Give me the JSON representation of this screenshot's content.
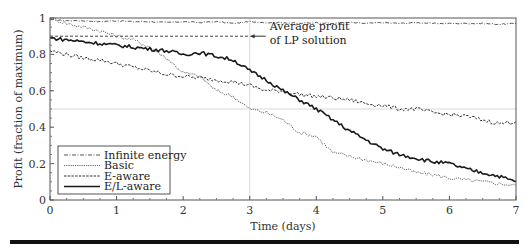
{
  "chart_data": {
    "type": "line",
    "title": "",
    "xlabel": "Time (days)",
    "ylabel": "Profit (fraction of maximum)",
    "xlim": [
      0,
      7
    ],
    "ylim": [
      0,
      1
    ],
    "xticks": [
      0,
      1,
      2,
      3,
      4,
      5,
      6,
      7
    ],
    "yticks": [
      0,
      0.2,
      0.4,
      0.6,
      0.8,
      1
    ],
    "ytick_labels": [
      "0",
      "0.2",
      "0.4",
      "0.6",
      "0.8",
      "1"
    ],
    "grid": false,
    "reference_lines": [
      {
        "type": "horizontal",
        "y": 0.9,
        "x_range": [
          0,
          3
        ],
        "style": "dashed",
        "label": "Average profit of LP solution"
      },
      {
        "type": "vertical",
        "x": 3,
        "style": "thin-gray"
      },
      {
        "type": "horizontal",
        "y": 0.5,
        "style": "thin-gray"
      }
    ],
    "annotation": {
      "text_line1": "Average profit",
      "text_line2": "of LP solution",
      "arrow_to": [
        3.0,
        0.9
      ]
    },
    "legend_position": "lower-left",
    "x": [
      0,
      0.25,
      0.5,
      0.75,
      1,
      1.25,
      1.5,
      1.75,
      2,
      2.25,
      2.5,
      2.75,
      3,
      3.25,
      3.5,
      3.75,
      4,
      4.25,
      4.5,
      4.75,
      5,
      5.25,
      5.5,
      5.75,
      6,
      6.25,
      6.5,
      6.75,
      7
    ],
    "series": [
      {
        "name": "Infinite energy",
        "style": "dash-dot",
        "values": [
          0.99,
          0.985,
          0.985,
          0.98,
          0.985,
          0.98,
          0.98,
          0.975,
          0.98,
          0.975,
          0.98,
          0.97,
          0.98,
          0.975,
          0.975,
          0.97,
          0.975,
          0.97,
          0.975,
          0.97,
          0.975,
          0.97,
          0.975,
          0.97,
          0.97,
          0.97,
          0.97,
          0.965,
          0.97
        ]
      },
      {
        "name": "Basic",
        "style": "dotted",
        "values": [
          1.0,
          0.97,
          0.95,
          0.93,
          0.9,
          0.88,
          0.84,
          0.78,
          0.7,
          0.68,
          0.6,
          0.57,
          0.5,
          0.48,
          0.44,
          0.37,
          0.35,
          0.26,
          0.24,
          0.22,
          0.2,
          0.18,
          0.15,
          0.14,
          0.12,
          0.11,
          0.1,
          0.09,
          0.08
        ]
      },
      {
        "name": "E-aware",
        "style": "dashed",
        "values": [
          0.82,
          0.8,
          0.78,
          0.77,
          0.75,
          0.73,
          0.71,
          0.69,
          0.68,
          0.67,
          0.66,
          0.65,
          0.63,
          0.6,
          0.6,
          0.58,
          0.57,
          0.56,
          0.55,
          0.53,
          0.52,
          0.5,
          0.5,
          0.48,
          0.47,
          0.46,
          0.44,
          0.42,
          0.43
        ]
      },
      {
        "name": "E/L-aware",
        "style": "solid",
        "values": [
          0.89,
          0.88,
          0.87,
          0.86,
          0.85,
          0.84,
          0.83,
          0.82,
          0.8,
          0.81,
          0.79,
          0.77,
          0.71,
          0.66,
          0.6,
          0.55,
          0.5,
          0.44,
          0.38,
          0.33,
          0.28,
          0.25,
          0.23,
          0.21,
          0.2,
          0.17,
          0.15,
          0.13,
          0.1
        ]
      }
    ]
  },
  "colors": {
    "frame": "#555555",
    "infinite_energy": "#555555",
    "basic": "#777777",
    "e_aware": "#333333",
    "el_aware": "#1a1a1a",
    "reference": "#cccccc"
  }
}
